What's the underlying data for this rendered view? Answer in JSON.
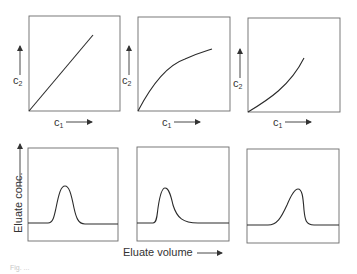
{
  "figure": {
    "top_row": {
      "panels": [
        {
          "id": "linear",
          "shape": "linear",
          "x_label": "c",
          "x_sub": "1",
          "y_label": "c",
          "y_sub": "2"
        },
        {
          "id": "convex",
          "shape": "convex (Langmuir)",
          "x_label": "c",
          "x_sub": "1",
          "y_label": "c",
          "y_sub": "2"
        },
        {
          "id": "concave",
          "shape": "concave (anti-Langmuir)",
          "x_label": "c",
          "x_sub": "1",
          "y_label": "c",
          "y_sub": "2"
        }
      ]
    },
    "bottom_row": {
      "y_label": "Eluate conc.",
      "x_label": "Eluate volume",
      "panels": [
        {
          "id": "symmetric",
          "shape": "symmetric peak"
        },
        {
          "id": "tailing",
          "shape": "sharp front, diffuse tail"
        },
        {
          "id": "fronting",
          "shape": "diffuse front, sharp tail"
        }
      ]
    },
    "caption": "Fig. ..."
  }
}
